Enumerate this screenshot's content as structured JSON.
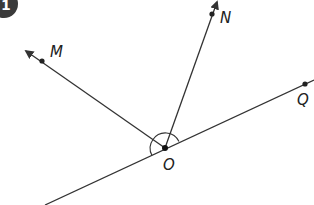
{
  "badge": {
    "number": "1",
    "color": "#3a3a3a"
  },
  "points": {
    "M": {
      "label": "M",
      "x": 42,
      "y": 61
    },
    "N": {
      "label": "N",
      "x": 212,
      "y": 14
    },
    "O": {
      "label": "O",
      "x": 165,
      "y": 148
    },
    "Q": {
      "label": "Q",
      "x": 305,
      "y": 84
    }
  },
  "rays": [
    {
      "from": "O",
      "through": "M",
      "arrow": true
    },
    {
      "from": "O",
      "through": "N",
      "arrow": true
    },
    {
      "from": "O",
      "through": "Q",
      "arrow": false
    }
  ],
  "line": {
    "description": "line through O and Q extending both directions"
  },
  "angle_mark": {
    "vertex": "O",
    "from": "Q",
    "to": "M",
    "type": "arc"
  },
  "colors": {
    "stroke": "#333333",
    "text": "#222222"
  }
}
